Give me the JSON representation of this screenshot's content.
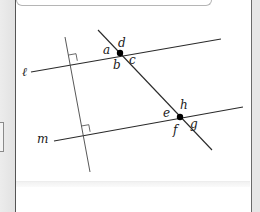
{
  "diagram": {
    "lines": {
      "l": {
        "label": "ℓ",
        "from": [
          31,
          72
        ],
        "to": [
          221,
          39
        ]
      },
      "m": {
        "label": "m",
        "from": [
          54,
          141
        ],
        "to": [
          243,
          107
        ]
      },
      "transversal": {
        "from": [
          98,
          30
        ],
        "to": [
          212,
          150
        ]
      },
      "perpendicular": {
        "from": [
          65,
          37
        ],
        "to": [
          90,
          172
        ]
      }
    },
    "intersections": [
      {
        "name": "upper",
        "point": [
          120,
          53
        ]
      },
      {
        "name": "lower",
        "point": [
          180,
          117
        ]
      }
    ],
    "angle_labels": {
      "a": "a",
      "b": "b",
      "c": "c",
      "d": "d",
      "e": "e",
      "f": "f",
      "g": "g",
      "h": "h"
    },
    "line_labels": {
      "l": "ℓ",
      "m": "m"
    },
    "colors": {
      "line": "#2a2a2a",
      "point": "#000000",
      "background": "#ffffff",
      "frame": "#555555"
    }
  }
}
